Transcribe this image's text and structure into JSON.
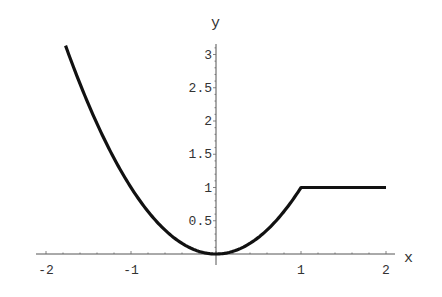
{
  "chart_data": {
    "type": "line",
    "title": "",
    "xlabel": "x",
    "ylabel": "y",
    "xlim": [
      -2.0,
      2.0
    ],
    "ylim": [
      0,
      3.2
    ],
    "grid": false,
    "legend": null,
    "x_ticks": [
      "-2",
      "-1",
      "1",
      "2"
    ],
    "y_ticks": [
      "0.5",
      "1",
      "1.5",
      "2",
      "2.5",
      "3"
    ],
    "series": [
      {
        "name": "piecewise: y = x^2 (x < 1), y = 1 (x >= 1)",
        "x": [
          -1.77,
          -1.5,
          -1.25,
          -1.0,
          -0.75,
          -0.5,
          -0.25,
          0.0,
          0.25,
          0.5,
          0.75,
          1.0,
          1.5,
          2.0
        ],
        "values": [
          3.13,
          2.25,
          1.56,
          1.0,
          0.56,
          0.25,
          0.06,
          0.0,
          0.06,
          0.25,
          0.56,
          1.0,
          1.0,
          1.0
        ]
      }
    ]
  },
  "axes": {
    "x_label": "x",
    "y_label": "y",
    "x_tick_labels": [
      {
        "label": "-2",
        "value": -2
      },
      {
        "label": "-1",
        "value": -1
      },
      {
        "label": "1",
        "value": 1
      },
      {
        "label": "2",
        "value": 2
      }
    ],
    "y_tick_labels": [
      {
        "label": "0.5",
        "value": 0.5
      },
      {
        "label": "1",
        "value": 1
      },
      {
        "label": "1.5",
        "value": 1.5
      },
      {
        "label": "2",
        "value": 2
      },
      {
        "label": "2.5",
        "value": 2.5
      },
      {
        "label": "3",
        "value": 3
      }
    ]
  },
  "style": {
    "curve_color": "#111111",
    "axis_color": "#555555"
  }
}
